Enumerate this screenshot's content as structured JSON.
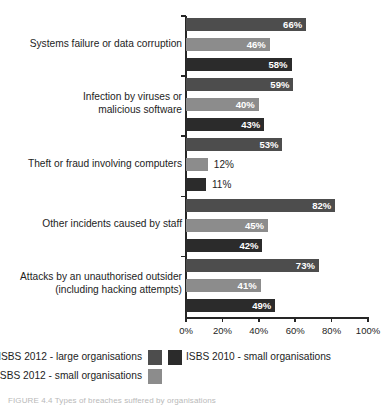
{
  "figure": {
    "caption": "FIGURE 4.4   Types of breaches suffered by organisations"
  },
  "chart_data": {
    "type": "bar",
    "orientation": "horizontal",
    "title": "",
    "xlabel": "",
    "ylabel": "",
    "xlim": [
      0,
      100
    ],
    "xticks": [
      "0%",
      "20%",
      "40%",
      "60%",
      "80%",
      "100%"
    ],
    "xtick_values": [
      0,
      20,
      40,
      60,
      80,
      100
    ],
    "grid": false,
    "legend_position": "bottom",
    "categories": [
      "Systems failure or data corruption",
      "Infection by viruses or\nmalicious software",
      "Theft or fraud involving computers",
      "Other incidents caused by staff",
      "Attacks by an unauthorised outsider\n(including hacking attempts)"
    ],
    "series": [
      {
        "name": "ISBS 2012 - large organisations",
        "color": "#4d4d4d",
        "values": [
          66,
          59,
          53,
          82,
          73
        ],
        "labels": [
          "66%",
          "59%",
          "53%",
          "82%",
          "73%"
        ]
      },
      {
        "name": "ISBS 2012 - small organisations",
        "color": "#8c8c8c",
        "values": [
          46,
          40,
          12,
          45,
          41
        ],
        "labels": [
          "46%",
          "40%",
          "12%",
          "45%",
          "41%"
        ]
      },
      {
        "name": "ISBS 2010 - small organisations",
        "color": "#2b2b2b",
        "values": [
          58,
          43,
          11,
          42,
          49
        ],
        "labels": [
          "58%",
          "43%",
          "11%",
          "42%",
          "49%"
        ]
      }
    ]
  },
  "legend": {
    "row1_left": "ISBS 2012 - large organisations",
    "row1_right": "ISBS 2010 - small organisations",
    "row2_left": "ISBS 2012 - small organisations"
  }
}
